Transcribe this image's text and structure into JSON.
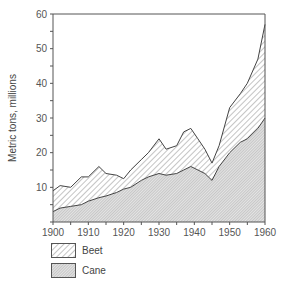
{
  "chart_data": {
    "type": "area",
    "stacked": true,
    "title": "",
    "xlabel": "",
    "ylabel": "Metric tons, millions",
    "xlim": [
      1900,
      1960
    ],
    "ylim": [
      0,
      60
    ],
    "x_ticks": [
      1900,
      1910,
      1920,
      1930,
      1940,
      1950,
      1960
    ],
    "y_ticks": [
      10,
      20,
      30,
      40,
      50,
      60
    ],
    "grid": false,
    "legend_position": "bottom-left",
    "x": [
      1900,
      1902,
      1905,
      1908,
      1910,
      1913,
      1915,
      1918,
      1920,
      1922,
      1925,
      1927,
      1930,
      1932,
      1935,
      1937,
      1939,
      1941,
      1943,
      1945,
      1947,
      1950,
      1953,
      1955,
      1958,
      1960
    ],
    "series": [
      {
        "name": "Cane",
        "pattern": "fine-crosshatch",
        "values": [
          3,
          4,
          4.5,
          5,
          6,
          7,
          7.5,
          8.5,
          9.5,
          10,
          12,
          13,
          14,
          13.5,
          14,
          15,
          16,
          15,
          14,
          12,
          16,
          20,
          23,
          24,
          27,
          30
        ]
      },
      {
        "name": "Beet",
        "pattern": "diagonal-hatch",
        "values": [
          6,
          6.5,
          5.5,
          8,
          7,
          9,
          6.5,
          5,
          3,
          5,
          6,
          7,
          10,
          7.5,
          8,
          11,
          11,
          9,
          7,
          5,
          6,
          13,
          14,
          16,
          20,
          27
        ]
      }
    ],
    "totals": [
      9,
      10.5,
      10,
      13,
      13,
      16,
      14,
      13.5,
      12.5,
      15,
      18,
      20,
      24,
      21,
      22,
      26,
      27,
      24,
      21,
      17,
      22,
      33,
      37,
      40,
      47,
      57
    ]
  },
  "legend": {
    "items": [
      {
        "label": "Beet",
        "pattern": "diagonal-hatch"
      },
      {
        "label": "Cane",
        "pattern": "fine-crosshatch"
      }
    ]
  },
  "colors": {
    "line": "#444444",
    "axis": "#555555",
    "beet_hatch": "#888888",
    "cane_fill": "#d6d6d6"
  }
}
